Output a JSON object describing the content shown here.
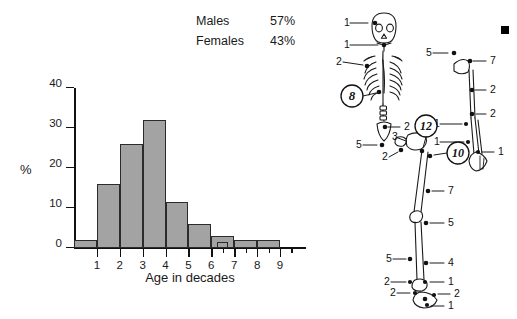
{
  "legend": {
    "rows": [
      {
        "label": "Males",
        "value": "57%"
      },
      {
        "label": "Females",
        "value": "43%"
      }
    ]
  },
  "chart_data": {
    "type": "bar",
    "title": "",
    "xlabel": "Age in decades",
    "ylabel": "%",
    "categories": [
      "0-1",
      "1-2",
      "2-3",
      "3-4",
      "4-5",
      "5-6",
      "6-7",
      "7-8",
      "8-9",
      "9-10"
    ],
    "x": [
      0.5,
      1.5,
      2.5,
      3.5,
      4.5,
      5.5,
      6.5,
      7.5,
      8.5,
      9.5
    ],
    "values": [
      2,
      16,
      26,
      32,
      11.5,
      6,
      3,
      2,
      2,
      0
    ],
    "extra_bars": [
      {
        "x": 6.25,
        "width": 0.5,
        "value": 1.5
      }
    ],
    "ylim": [
      0,
      40
    ],
    "yticks": [
      0,
      10,
      20,
      30,
      40
    ],
    "ytick_labels": [
      "0",
      "10",
      "20",
      "30",
      "40"
    ],
    "xlim": [
      0,
      9.7
    ],
    "xticks": [
      1,
      2,
      3,
      4,
      5,
      6,
      7,
      8,
      9
    ],
    "xtick_labels": [
      "1",
      "2",
      "3",
      "4",
      "5",
      "6",
      "7",
      "8",
      "9"
    ],
    "grid": false,
    "legend_position": "above-right",
    "bar_color": "#a3a3a3",
    "bar_edge_color": "#2b2b2b"
  },
  "figure": {
    "name": "skeleton-fracture-distribution-diagram",
    "skull_labels": [
      "1",
      "1",
      "2"
    ],
    "circled_counts": [
      "8",
      "12",
      "10"
    ],
    "spine_pelvis_labels": [
      "2",
      "5",
      "3",
      "2"
    ],
    "arm_labels": [
      "5",
      "7",
      "2",
      "2",
      "1",
      "1",
      "1"
    ],
    "leg_labels": [
      "1",
      "7",
      "5",
      "5",
      "4"
    ],
    "foot_labels": [
      "2",
      "1",
      "2",
      "2",
      "1"
    ],
    "hand_labels": [
      "1"
    ]
  }
}
